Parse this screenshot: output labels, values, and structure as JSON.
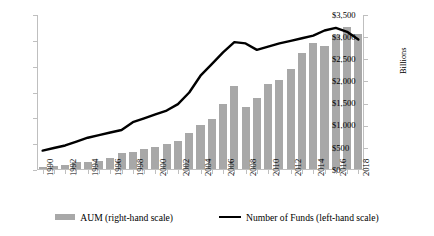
{
  "chart_data": {
    "type": "bar",
    "title": "",
    "xlabel": "",
    "ylabel": "",
    "grid": false,
    "legend_position": "bottom",
    "categories": [
      "1990",
      "1991",
      "1992",
      "1993",
      "1994",
      "1995",
      "1996",
      "1997",
      "1998",
      "1999",
      "2000",
      "2001",
      "2002",
      "2003",
      "2004",
      "2005",
      "2006",
      "2007",
      "2008",
      "2009",
      "2010",
      "2011",
      "2012",
      "2013",
      "2014",
      "2015",
      "2016",
      "2017",
      "2018"
    ],
    "x_tick_labels": [
      "1990",
      "1992",
      "1994",
      "1996",
      "1998",
      "2000",
      "2002",
      "2004",
      "2006",
      "2008",
      "2010",
      "2012",
      "2014",
      "2016",
      "2018"
    ],
    "left_axis": {
      "label": "",
      "ylim": [
        0,
        12000
      ],
      "ticks": [
        0,
        2000,
        4000,
        6000,
        8000,
        10000,
        12000
      ],
      "tick_labels": [
        "0",
        "2,000",
        "4,000",
        "6,000",
        "8,000",
        "10,000",
        "12,000"
      ]
    },
    "right_axis": {
      "label": "Billions",
      "ylim": [
        0,
        3500
      ],
      "ticks": [
        0,
        500,
        1000,
        1500,
        2000,
        2500,
        3000,
        3500
      ],
      "tick_labels": [
        "$0",
        "$500",
        "$1,000",
        "$1,500",
        "$2,000",
        "$2,500",
        "$3,000",
        "$3,500"
      ]
    },
    "series": [
      {
        "name": "AUM (right-hand scale)",
        "type": "bar",
        "axis": "right",
        "units": "Billions of dollars",
        "color": "#a8a8a8",
        "values": [
          39,
          58,
          96,
          168,
          156,
          186,
          256,
          368,
          375,
          456,
          491,
          564,
          626,
          820,
          1002,
          1130,
          1465,
          1868,
          1407,
          1600,
          1917,
          2008,
          2252,
          2628,
          2845,
          2780,
          3018,
          3212,
          3050
        ]
      },
      {
        "name": "Number of Funds (left-hand scale)",
        "type": "line",
        "axis": "left",
        "color": "#000000",
        "values": [
          1500,
          1700,
          1900,
          2200,
          2500,
          2700,
          2900,
          3100,
          3700,
          4000,
          4300,
          4600,
          5100,
          6000,
          7300,
          8200,
          9100,
          9900,
          9800,
          9300,
          9550,
          9800,
          10000,
          10200,
          10400,
          10800,
          11000,
          10700,
          10100
        ]
      }
    ]
  },
  "legend": {
    "items": [
      {
        "label": "AUM (right-hand scale)",
        "marker": "bar-swatch"
      },
      {
        "label": "Number of Funds (left-hand scale)",
        "marker": "line-swatch"
      }
    ]
  }
}
